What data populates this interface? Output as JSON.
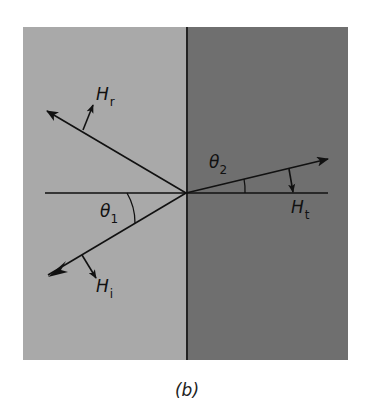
{
  "figure": {
    "caption": "(b)",
    "colors": {
      "background": "#ffffff",
      "medium_1": "#a9a9a9",
      "medium_2": "#6f6f6f",
      "lines": "#111111"
    },
    "labels": {
      "theta1": {
        "symbol": "θ",
        "subscript": "1"
      },
      "theta2": {
        "symbol": "θ",
        "subscript": "2"
      },
      "H_r": {
        "symbol": "H",
        "subscript": "r"
      },
      "H_i": {
        "symbol": "H",
        "subscript": "i"
      },
      "H_t": {
        "symbol": "H",
        "subscript": "t"
      }
    },
    "rays": [
      {
        "name": "incident",
        "angle_deg_below_normal": 30.7
      },
      {
        "name": "reflected",
        "angle_deg_above_normal": 30.7
      },
      {
        "name": "transmitted",
        "angle_deg_above_normal": 13.5
      }
    ]
  }
}
